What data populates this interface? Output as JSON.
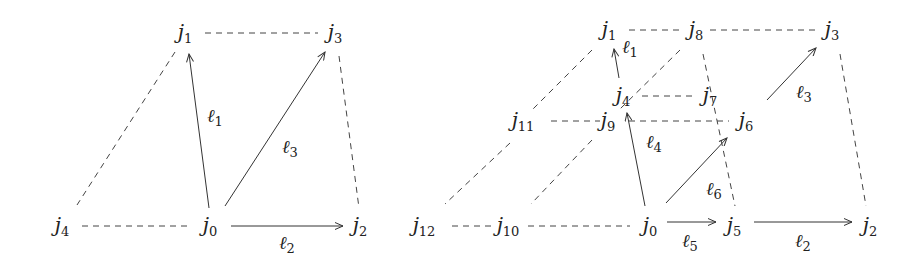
{
  "figure": {
    "panels": [
      {
        "name": "left-diagram",
        "nodes": [
          {
            "id": "j0",
            "base": "j",
            "sub": "0",
            "x": 210,
            "y": 226
          },
          {
            "id": "j1",
            "base": "j",
            "sub": "1",
            "x": 185,
            "y": 33
          },
          {
            "id": "j2",
            "base": "j",
            "sub": "2",
            "x": 360,
            "y": 226
          },
          {
            "id": "j3",
            "base": "j",
            "sub": "3",
            "x": 335,
            "y": 33
          },
          {
            "id": "j4",
            "base": "j",
            "sub": "4",
            "x": 62,
            "y": 226
          }
        ],
        "arrows": [
          {
            "from": [
              209,
              208
            ],
            "to": [
              189,
              54
            ],
            "label": "ℓ",
            "sub": "1",
            "lx": 215,
            "ly": 117
          },
          {
            "from": [
              225,
              206
            ],
            "to": [
              325,
              52
            ],
            "label": "ℓ",
            "sub": "3",
            "lx": 290,
            "ly": 148
          },
          {
            "from": [
              231,
              226
            ],
            "to": [
              343,
              226
            ],
            "label": "ℓ",
            "sub": "2",
            "lx": 287,
            "ly": 244
          }
        ],
        "dashed": [
          [
            [
              205,
              33
            ],
            [
              318,
              33
            ]
          ],
          [
            [
              175,
              52
            ],
            [
              77,
              205
            ]
          ],
          [
            [
              82,
              226
            ],
            [
              192,
              226
            ]
          ],
          [
            [
              339,
              56
            ],
            [
              359,
              208
            ]
          ]
        ]
      },
      {
        "name": "right-diagram",
        "nodes": [
          {
            "id": "j0",
            "base": "j",
            "sub": "0",
            "x": 650,
            "y": 226
          },
          {
            "id": "j1",
            "base": "j",
            "sub": "1",
            "x": 609,
            "y": 30
          },
          {
            "id": "j2",
            "base": "j",
            "sub": "2",
            "x": 870,
            "y": 226
          },
          {
            "id": "j3",
            "base": "j",
            "sub": "3",
            "x": 832,
            "y": 30
          },
          {
            "id": "j4",
            "base": "j",
            "sub": "4",
            "x": 623,
            "y": 96
          },
          {
            "id": "j5",
            "base": "j",
            "sub": "5",
            "x": 734,
            "y": 226
          },
          {
            "id": "j6",
            "base": "j",
            "sub": "6",
            "x": 746,
            "y": 121
          },
          {
            "id": "j7",
            "base": "j",
            "sub": "7",
            "x": 710,
            "y": 96
          },
          {
            "id": "j8",
            "base": "j",
            "sub": "8",
            "x": 696,
            "y": 30
          },
          {
            "id": "j9",
            "base": "j",
            "sub": "9",
            "x": 608,
            "y": 121
          },
          {
            "id": "j10",
            "base": "j",
            "sub": "10",
            "x": 508,
            "y": 226
          },
          {
            "id": "j11",
            "base": "j",
            "sub": "11",
            "x": 523,
            "y": 121
          },
          {
            "id": "j12",
            "base": "j",
            "sub": "12",
            "x": 424,
            "y": 226
          }
        ],
        "arrows": [
          {
            "from": [
              619,
              78
            ],
            "to": [
              614,
              49
            ],
            "label": "ℓ",
            "sub": "1",
            "lx": 630,
            "ly": 48
          },
          {
            "from": [
              645,
              206
            ],
            "to": [
              627,
              113
            ],
            "label": "ℓ",
            "sub": "4",
            "lx": 654,
            "ly": 143
          },
          {
            "from": [
              666,
              203
            ],
            "to": [
              727,
              138
            ],
            "label": "ℓ",
            "sub": "6",
            "lx": 714,
            "ly": 190
          },
          {
            "from": [
              767,
              100
            ],
            "to": [
              816,
              48
            ],
            "label": "ℓ",
            "sub": "3",
            "lx": 804,
            "ly": 93
          },
          {
            "from": [
              667,
              222
            ],
            "to": [
              716,
              222
            ],
            "label": "ℓ",
            "sub": "5",
            "lx": 690,
            "ly": 242
          },
          {
            "from": [
              754,
              222
            ],
            "to": [
              852,
              222
            ],
            "label": "ℓ",
            "sub": "2",
            "lx": 803,
            "ly": 242
          }
        ],
        "dashed": [
          [
            [
              629,
              30
            ],
            [
              682,
              30
            ]
          ],
          [
            [
              710,
              30
            ],
            [
              815,
              30
            ]
          ],
          [
            [
              592,
              50
            ],
            [
              531,
              111
            ]
          ],
          [
            [
              680,
              50
            ],
            [
              619,
              110
            ]
          ],
          [
            [
              642,
              96
            ],
            [
              694,
              96
            ]
          ],
          [
            [
              551,
              121
            ],
            [
              600,
              121
            ]
          ],
          [
            [
              629,
              121
            ],
            [
              729,
              121
            ]
          ],
          [
            [
              703,
              54
            ],
            [
              735,
              206
            ]
          ],
          [
            [
              840,
              54
            ],
            [
              866,
              206
            ]
          ],
          [
            [
              510,
              143
            ],
            [
              445,
              204
            ]
          ],
          [
            [
              592,
              140
            ],
            [
              531,
              204
            ]
          ],
          [
            [
              452,
              226
            ],
            [
              496,
              226
            ]
          ],
          [
            [
              528,
              226
            ],
            [
              630,
              226
            ]
          ]
        ]
      }
    ]
  }
}
